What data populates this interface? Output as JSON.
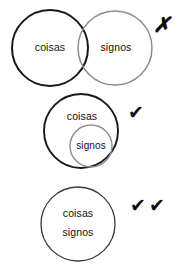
{
  "diagram": {
    "background_color": "#ffffff",
    "label_color": "#111111",
    "rows": [
      {
        "id": "row-overlapping",
        "relation": "overlapping",
        "verdict": "incorrect",
        "verdict_mark": "✗",
        "verdict_mark_name": "cross-mark",
        "verdict_mark_count": 1,
        "circles": [
          {
            "id": "coisas-circle-overlap",
            "label": "coisas",
            "cx": 50,
            "cy": 48,
            "r": 38,
            "stroke": "#1a1a1a",
            "stroke_width": 2.0,
            "label_x": 50,
            "label_y": 48
          },
          {
            "id": "signos-circle-overlap",
            "label": "signos",
            "cx": 115,
            "cy": 48,
            "r": 37,
            "stroke": "#8d8d8d",
            "stroke_width": 1.5,
            "label_x": 116,
            "label_y": 48
          }
        ],
        "mark_x": 162,
        "mark_y": 27
      },
      {
        "id": "row-nested",
        "relation": "nested",
        "verdict": "correct",
        "verdict_mark": "✔",
        "verdict_mark_name": "check-mark",
        "verdict_mark_count": 1,
        "circles": [
          {
            "id": "coisas-circle-nested",
            "label": "coisas",
            "cx": 81,
            "cy": 131,
            "r": 37,
            "stroke": "#1a1a1a",
            "stroke_width": 1.9,
            "label_x": 82,
            "label_y": 117
          },
          {
            "id": "signos-circle-nested",
            "label": "signos",
            "cx": 91,
            "cy": 146,
            "r": 21,
            "stroke": "#8d8d8d",
            "stroke_width": 1.4,
            "label_x": 91,
            "label_y": 146
          }
        ],
        "mark_x": 136,
        "mark_y": 113
      },
      {
        "id": "row-identical",
        "relation": "identical",
        "verdict": "best",
        "verdict_mark": "✔",
        "verdict_mark_name": "check-mark",
        "verdict_mark_count": 2,
        "circles": [
          {
            "id": "coisas-signos-circle",
            "label": "coisas",
            "label_secondary": "signos",
            "cx": 78,
            "cy": 224,
            "r": 37,
            "stroke": "#3a3a3a",
            "stroke_width": 1.3,
            "label_x": 78,
            "label_y": 214,
            "label_secondary_x": 78,
            "label_secondary_y": 233
          }
        ],
        "mark_x": 138,
        "mark_y": 206,
        "mark_x2": 157,
        "mark_y2": 206
      }
    ]
  }
}
